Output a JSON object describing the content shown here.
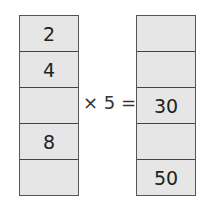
{
  "left_column": {
    "cells": [
      "2",
      "4",
      "",
      "8",
      ""
    ]
  },
  "operator": "× 5 =",
  "right_column": {
    "cells": [
      "",
      "",
      "30",
      "",
      "50"
    ]
  },
  "colors": {
    "cell_fill": "#e6e6e6",
    "border": "#555555",
    "text": "#222222"
  }
}
